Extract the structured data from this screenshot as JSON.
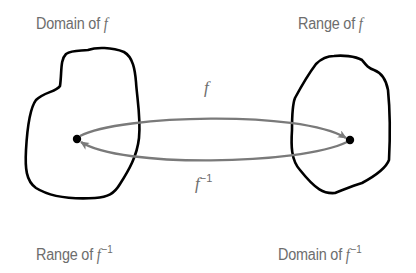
{
  "diagram": {
    "type": "function-inverse-mapping",
    "labels": {
      "top_left": {
        "prefix": "Domain of ",
        "fn": "f",
        "sup": ""
      },
      "top_right": {
        "prefix": "Range of ",
        "fn": "f",
        "sup": ""
      },
      "bottom_left": {
        "prefix": "Range of ",
        "fn": "f",
        "sup": "−1"
      },
      "bottom_right": {
        "prefix": "Domain of ",
        "fn": "f",
        "sup": "−1"
      }
    },
    "arrows": {
      "forward": {
        "fn": "f",
        "sup": "",
        "from": "left-point",
        "to": "right-point"
      },
      "inverse": {
        "fn": "f",
        "sup": "−1",
        "from": "right-point",
        "to": "left-point"
      }
    },
    "colors": {
      "text": "#6d6d6d",
      "arrow": "#7a7a7a",
      "region_outline": "#000000",
      "point": "#000000"
    }
  }
}
